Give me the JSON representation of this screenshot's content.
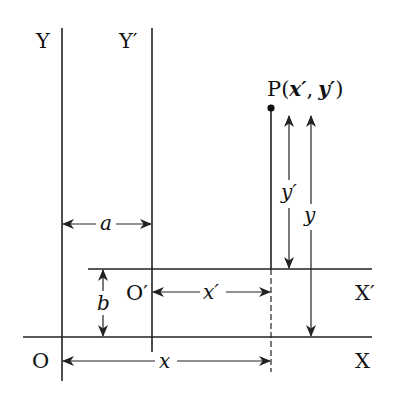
{
  "diagram": {
    "axes": {
      "original": {
        "origin_label": "O",
        "x_label": "X",
        "y_label": "Y"
      },
      "translated": {
        "origin_label": "O′",
        "x_label": "X′",
        "y_label": "Y′"
      }
    },
    "point": {
      "label": "P",
      "coords_text": "(x′, y′)",
      "open_paren": "(",
      "x_coord": "x′",
      "comma": ",",
      "y_coord": "y′",
      "close_paren": ")"
    },
    "dimensions": {
      "a": "a",
      "b": "b",
      "x": "x",
      "x_prime": "x′",
      "y": "y",
      "y_prime": "y′"
    },
    "colors": {
      "line": "#222222",
      "background": "#ffffff",
      "text": "#111111"
    }
  }
}
